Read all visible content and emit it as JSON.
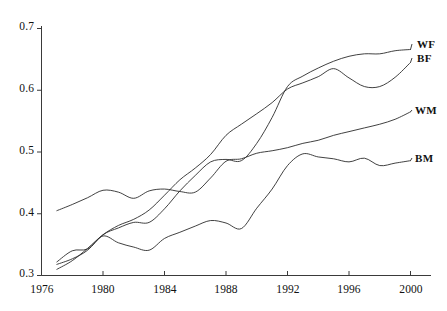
{
  "chart_data": {
    "type": "line",
    "title": "",
    "subtitle": "",
    "xlabel": "",
    "ylabel": "",
    "xlim": [
      1976,
      2000.8
    ],
    "ylim": [
      0.3,
      0.715
    ],
    "grid": false,
    "legend_position": "right-end-labels",
    "x_ticks": [
      1976,
      1980,
      1984,
      1988,
      1992,
      1996,
      2000
    ],
    "x_tick_labels": [
      "1976",
      "1980",
      "1984",
      "1988",
      "1992",
      "1996",
      "2000"
    ],
    "y_ticks": [
      0.3,
      0.4,
      0.5,
      0.6,
      0.7
    ],
    "y_tick_labels": [
      "0.3",
      "0.4",
      "0.5",
      "0.6",
      "0.7"
    ],
    "series": [
      {
        "name": "WF",
        "label": "WF",
        "color": "#2b2b2b",
        "x": [
          1977,
          1978,
          1979,
          1980,
          1981,
          1982,
          1983,
          1984,
          1985,
          1986,
          1987,
          1988,
          1989,
          1990,
          1991,
          1992,
          1993,
          1994,
          1995,
          1996,
          1997,
          1998,
          1999,
          2000
        ],
        "values": [
          0.318,
          0.327,
          0.341,
          0.366,
          0.377,
          0.386,
          0.386,
          0.408,
          0.437,
          0.462,
          0.484,
          0.488,
          0.486,
          0.514,
          0.556,
          0.606,
          0.623,
          0.636,
          0.647,
          0.655,
          0.659,
          0.659,
          0.664,
          0.666
        ]
      },
      {
        "name": "BF",
        "label": "BF",
        "color": "#2b2b2b",
        "x": [
          1977,
          1978,
          1979,
          1980,
          1981,
          1982,
          1983,
          1984,
          1985,
          1986,
          1987,
          1988,
          1989,
          1990,
          1991,
          1992,
          1993,
          1994,
          1995,
          1996,
          1997,
          1998,
          1999,
          2000
        ],
        "values": [
          0.31,
          0.324,
          0.344,
          0.366,
          0.381,
          0.391,
          0.406,
          0.43,
          0.455,
          0.474,
          0.496,
          0.527,
          0.545,
          0.562,
          0.58,
          0.602,
          0.612,
          0.622,
          0.635,
          0.62,
          0.606,
          0.606,
          0.621,
          0.645
        ]
      },
      {
        "name": "WM",
        "label": "WM",
        "color": "#2b2b2b",
        "x": [
          1977,
          1978,
          1979,
          1980,
          1981,
          1982,
          1983,
          1984,
          1985,
          1986,
          1987,
          1988,
          1989,
          1990,
          1991,
          1992,
          1993,
          1994,
          1995,
          1996,
          1997,
          1998,
          1999,
          2000
        ],
        "values": [
          0.405,
          0.415,
          0.426,
          0.438,
          0.435,
          0.425,
          0.437,
          0.44,
          0.436,
          0.435,
          0.458,
          0.485,
          0.489,
          0.498,
          0.502,
          0.507,
          0.514,
          0.519,
          0.527,
          0.533,
          0.539,
          0.545,
          0.553,
          0.565
        ]
      },
      {
        "name": "BM",
        "label": "BM",
        "color": "#2b2b2b",
        "x": [
          1977,
          1978,
          1979,
          1980,
          1981,
          1982,
          1983,
          1984,
          1985,
          1986,
          1987,
          1988,
          1989,
          1990,
          1991,
          1992,
          1993,
          1994,
          1995,
          1996,
          1997,
          1998,
          1999,
          2000
        ],
        "values": [
          0.322,
          0.34,
          0.343,
          0.364,
          0.353,
          0.346,
          0.341,
          0.36,
          0.37,
          0.38,
          0.389,
          0.385,
          0.376,
          0.409,
          0.44,
          0.478,
          0.497,
          0.492,
          0.489,
          0.484,
          0.49,
          0.478,
          0.482,
          0.486
        ]
      }
    ]
  },
  "axes": {
    "y_label_0": "0.7",
    "y_label_1": "0.6",
    "y_label_2": "0.5",
    "y_label_3": "0.4",
    "y_label_4": "0.3",
    "x_label_0": "1976",
    "x_label_1": "1980",
    "x_label_2": "1984",
    "x_label_3": "1988",
    "x_label_4": "1992",
    "x_label_5": "1996",
    "x_label_6": "2000"
  },
  "series_labels": {
    "wf": "WF",
    "bf": "BF",
    "wm": "WM",
    "bm": "BM"
  }
}
